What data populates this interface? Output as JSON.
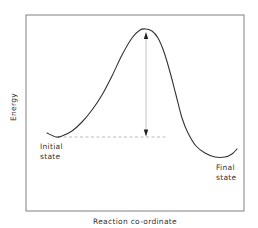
{
  "diagram": {
    "y_axis_label": "Energy",
    "x_axis_label": "Reaction co-ordinate",
    "initial_state": {
      "line1": "Initial",
      "line2": "state"
    },
    "final_state": {
      "line1": "Final",
      "line2": "state"
    },
    "colors": {
      "frame": "#808080",
      "curve": "#333333",
      "arrow": "#bbbbbb",
      "arrowhead": "#222222",
      "dashed": "#aaaaaa",
      "text": "#333333"
    },
    "frame": {
      "x": 26,
      "y": 15,
      "width": 218,
      "height": 196
    },
    "curve_points": [
      [
        47,
        133
      ],
      [
        56,
        137
      ],
      [
        62,
        136
      ],
      [
        72,
        131
      ],
      [
        82,
        122
      ],
      [
        92,
        110
      ],
      [
        102,
        95
      ],
      [
        112,
        76
      ],
      [
        122,
        55
      ],
      [
        132,
        38
      ],
      [
        140,
        30
      ],
      [
        146,
        29
      ],
      [
        152,
        31
      ],
      [
        158,
        38
      ],
      [
        164,
        52
      ],
      [
        170,
        72
      ],
      [
        176,
        95
      ],
      [
        182,
        118
      ],
      [
        188,
        133
      ],
      [
        196,
        146
      ],
      [
        205,
        153
      ],
      [
        215,
        157
      ],
      [
        225,
        157
      ],
      [
        232,
        154
      ],
      [
        237,
        149
      ]
    ],
    "activation_arrow": {
      "x": 146,
      "y_top": 33,
      "y_bottom": 136
    },
    "baseline_dashed": {
      "y": 137,
      "x_start": 58,
      "x_end": 167
    }
  }
}
